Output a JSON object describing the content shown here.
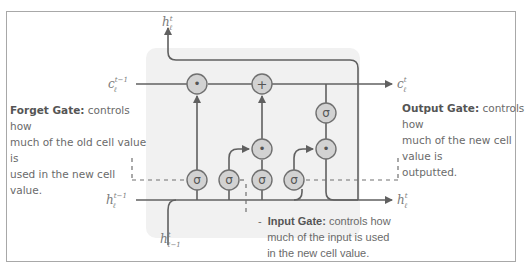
{
  "diagram": {
    "background_color": "#ffffff",
    "cell_background": "#f1f1f1",
    "line_color": "#606060",
    "gate_fill": "#d2d2d2",
    "labels": {
      "h_out_top": "h",
      "h_out_top_sup": "t",
      "h_out_top_sub": "ℓ",
      "c_in": "c",
      "c_in_sup": "t−1",
      "c_in_sub": "ℓ",
      "c_out": "c",
      "c_out_sup": "t",
      "c_out_sub": "ℓ",
      "h_in": "h",
      "h_in_sup": "t−1",
      "h_in_sub": "ℓ",
      "h_out_right": "h",
      "h_out_right_sup": "t",
      "h_out_right_sub": "ℓ",
      "x_in": "h",
      "x_in_sup": "t",
      "x_in_sub": "ℓ−1"
    },
    "gates": [
      {
        "id": "forget-sigma",
        "symbol": "σ"
      },
      {
        "id": "input-sigma",
        "symbol": "σ"
      },
      {
        "id": "candidate-sigma",
        "symbol": "σ"
      },
      {
        "id": "output-sigma",
        "symbol": "σ"
      },
      {
        "id": "cell-sigma",
        "symbol": "σ"
      },
      {
        "id": "forget-mult",
        "symbol": "•"
      },
      {
        "id": "add",
        "symbol": "+"
      },
      {
        "id": "input-mult",
        "symbol": "•"
      },
      {
        "id": "output-mult",
        "symbol": "•"
      }
    ],
    "captions": {
      "forget_title": "Forget Gate:",
      "forget_text_1": " controls how",
      "forget_text_2": " much of the old cell value is",
      "forget_text_3": "used in the new cell value.",
      "output_title": "Output Gate:",
      "output_text_1": " controls how",
      "output_text_2": "much of the new cell value is",
      "output_text_3": "outputted.",
      "input_dash": "-",
      "input_title": "Input Gate:",
      "input_text_1": " controls how",
      "input_text_2": "much of the input is used",
      "input_text_3": "in the new cell value."
    }
  }
}
